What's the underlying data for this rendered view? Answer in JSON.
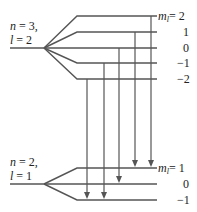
{
  "upper_state": {
    "n_label": "n = 3,",
    "l_label": "l = 2",
    "ml_prefix": "m",
    "ml_sub": "l",
    "levels": [
      {
        "ml": "2",
        "y": 16,
        "label": "= 2"
      },
      {
        "ml": "1",
        "y": 32,
        "label": "1"
      },
      {
        "ml": "0",
        "y": 48,
        "label": "0"
      },
      {
        "ml": "-1",
        "y": 63,
        "label": "−1"
      },
      {
        "ml": "-2",
        "y": 79,
        "label": "−2"
      }
    ]
  },
  "lower_state": {
    "n_label": "n = 2,",
    "l_label": "l = 1",
    "ml_prefix": "m",
    "ml_sub": "l",
    "levels": [
      {
        "ml": "1",
        "y": 168,
        "label": "= 1"
      },
      {
        "ml": "0",
        "y": 184,
        "label": "0"
      },
      {
        "ml": "-1",
        "y": 200,
        "label": "−1"
      }
    ]
  },
  "transitions": [
    {
      "from_ml": "2",
      "to_ml": "1",
      "x": 151
    },
    {
      "from_ml": "1",
      "to_ml": "1",
      "x": 135
    },
    {
      "from_ml": "0",
      "to_ml": "0",
      "x": 119
    },
    {
      "from_ml": "-1",
      "to_ml": "-1",
      "x": 104
    },
    {
      "from_ml": "-2",
      "to_ml": "-1",
      "x": 87
    }
  ],
  "colors": {
    "line": "#555555",
    "text": "#222222",
    "background": "#ffffff"
  }
}
